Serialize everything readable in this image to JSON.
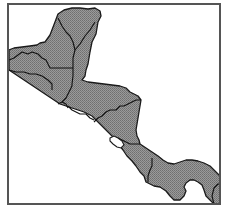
{
  "map": {
    "title": "",
    "region": "Central America",
    "colors": {
      "background": "#ffffff",
      "land": "#8e8e8e",
      "land_dot": "#6f6f6f",
      "border": "#111111",
      "frame": "#555555",
      "water": "#ffffff"
    },
    "frame": {
      "x": 8,
      "y": 4,
      "width": 212,
      "height": 200
    },
    "countries": [
      {
        "id": "mexico",
        "name": "Mexico"
      },
      {
        "id": "belize",
        "name": "Belize"
      },
      {
        "id": "guatemala",
        "name": "Guatemala"
      },
      {
        "id": "el-salvador",
        "name": "El Salvador"
      },
      {
        "id": "honduras",
        "name": "Honduras"
      },
      {
        "id": "nicaragua",
        "name": "Nicaragua"
      },
      {
        "id": "costa-rica",
        "name": "Costa Rica"
      },
      {
        "id": "panama",
        "name": "Panama"
      },
      {
        "id": "colombia",
        "name": "Colombia"
      }
    ],
    "water_bodies": [
      {
        "id": "lake-nicaragua",
        "name": "Lake Nicaragua"
      }
    ]
  }
}
